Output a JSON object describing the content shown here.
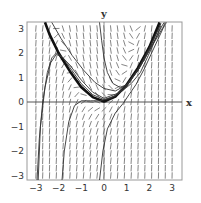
{
  "chart_data": {
    "type": "line",
    "title": "",
    "subtitle": "Slope field (direction field) with solution curves",
    "xlabel": "x",
    "ylabel": "y",
    "xlim": [
      -3.15,
      3.15
    ],
    "ylim": [
      -3.2,
      3.25
    ],
    "grid": false,
    "legend": "none",
    "x_ticks": [
      -3,
      -2,
      -1,
      0,
      1,
      2,
      3
    ],
    "y_ticks": [
      -3,
      -2,
      -1,
      0,
      1,
      2,
      3
    ],
    "x_tick_labels": [
      "−3",
      "−2",
      "−1",
      "0",
      "1",
      "2",
      "3"
    ],
    "y_tick_labels": [
      "−3",
      "−2",
      "−1",
      "0",
      "1",
      "2",
      "3"
    ],
    "slope_field": {
      "grid_step": 0.3,
      "description": "short line segments; steep positive below the parabola, negative above it, tangent to y = x^2 along it"
    },
    "series": [
      {
        "name": "thick-parabola",
        "style": "thick",
        "points": [
          [
            -2.6,
            3.25
          ],
          [
            -2.4,
            2.76
          ],
          [
            -2,
            2
          ],
          [
            -1.5,
            1.25
          ],
          [
            -1,
            0.6
          ],
          [
            -0.5,
            0.2
          ],
          [
            0,
            0.02
          ],
          [
            0.5,
            0.22
          ],
          [
            1,
            0.7
          ],
          [
            1.5,
            1.4
          ],
          [
            2,
            2.25
          ],
          [
            2.45,
            3.25
          ]
        ]
      },
      {
        "name": "solution-from-left-bottom",
        "style": "thin",
        "points": [
          [
            -2.95,
            -3.2
          ],
          [
            -2.85,
            -1.5
          ],
          [
            -2.7,
            0
          ],
          [
            -2.5,
            1.2
          ],
          [
            -2.3,
            1.8
          ],
          [
            -2.1,
            2
          ],
          [
            -1.9,
            1.9
          ],
          [
            -1.5,
            1.4
          ],
          [
            -1,
            0.75
          ],
          [
            -0.5,
            0.3
          ],
          [
            0,
            0.1
          ],
          [
            0.5,
            0.25
          ],
          [
            1,
            0.65
          ],
          [
            1.5,
            1.3
          ],
          [
            2,
            2.15
          ],
          [
            2.5,
            3.2
          ]
        ]
      },
      {
        "name": "solution-from-left-mid",
        "style": "thin",
        "points": [
          [
            -2.9,
            -3.2
          ],
          [
            -2.8,
            -1
          ],
          [
            -2.6,
            0.6
          ],
          [
            -2.35,
            1.6
          ],
          [
            -2.1,
            1.95
          ],
          [
            -1.8,
            1.8
          ],
          [
            -1.5,
            1.5
          ],
          [
            -1,
            0.9
          ],
          [
            -0.5,
            0.4
          ],
          [
            0,
            0.15
          ],
          [
            0.6,
            0.35
          ],
          [
            1,
            0.7
          ],
          [
            1.5,
            1.35
          ],
          [
            2,
            2.2
          ],
          [
            2.5,
            3.2
          ]
        ]
      },
      {
        "name": "solution-from-minus-two",
        "style": "thin",
        "points": [
          [
            -1.85,
            -3.2
          ],
          [
            -1.75,
            -2
          ],
          [
            -1.55,
            -0.8
          ],
          [
            -1.3,
            -0.15
          ],
          [
            -1,
            0.05
          ],
          [
            -0.6,
            0.05
          ],
          [
            -0.2,
            0.05
          ],
          [
            0.3,
            0.15
          ],
          [
            0.8,
            0.45
          ],
          [
            1.2,
            0.75
          ],
          [
            1.6,
            1.2
          ],
          [
            2.1,
            2.2
          ],
          [
            2.5,
            3.1
          ]
        ]
      },
      {
        "name": "solution-from-zero-bottom",
        "style": "thin",
        "points": [
          [
            -0.2,
            -3.2
          ],
          [
            -0.05,
            -2
          ],
          [
            0.15,
            -1.1
          ],
          [
            0.5,
            -0.45
          ],
          [
            0.85,
            -0.05
          ],
          [
            1.1,
            0.3
          ],
          [
            1.4,
            0.7
          ],
          [
            1.8,
            1.4
          ],
          [
            2.2,
            2.2
          ],
          [
            2.6,
            3.0
          ],
          [
            2.75,
            3.25
          ]
        ]
      },
      {
        "name": "solution-from-top",
        "style": "thin",
        "points": [
          [
            -0.2,
            3.25
          ],
          [
            -0.1,
            2.5
          ],
          [
            0,
            1.8
          ],
          [
            0.15,
            1.2
          ],
          [
            0.4,
            0.75
          ],
          [
            0.7,
            0.6
          ],
          [
            1,
            0.7
          ],
          [
            1.5,
            1.3
          ],
          [
            2,
            2.1
          ],
          [
            2.6,
            3.05
          ],
          [
            2.7,
            3.25
          ]
        ]
      },
      {
        "name": "solution-from-top-2",
        "style": "thin",
        "points": [
          [
            -2.3,
            3.25
          ],
          [
            -1.9,
            2.6
          ],
          [
            -1.4,
            1.9
          ],
          [
            -0.9,
            1.3
          ],
          [
            -0.4,
            0.8
          ],
          [
            0,
            0.55
          ],
          [
            0.5,
            0.45
          ],
          [
            1,
            0.7
          ],
          [
            1.5,
            1.3
          ],
          [
            2,
            2.1
          ],
          [
            2.55,
            3.1
          ],
          [
            2.65,
            3.25
          ]
        ]
      }
    ]
  },
  "labels": {
    "x_axis": "x",
    "y_axis": "y"
  },
  "colors": {
    "frame": "#999999",
    "axis": "#555555",
    "field": "#666666",
    "curve": "#333333",
    "thick_curve": "#111111"
  }
}
